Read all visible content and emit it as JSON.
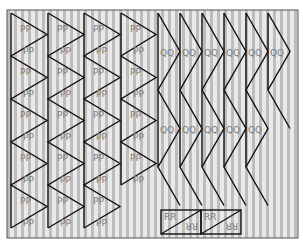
{
  "figure": {
    "width": 303,
    "height": 244,
    "frame": {
      "x": 7,
      "y": 10,
      "w": 291,
      "h": 228,
      "stroke": "#555555"
    },
    "background": {
      "stripe_light": "#e9e9e9",
      "stripe_dark": "#bdbdbd",
      "period": 7,
      "dark_width": 3
    }
  },
  "pp_group": {
    "label": "PP",
    "columns": [
      {
        "x": 11,
        "width": 36,
        "top": 13,
        "vertices": 10
      },
      {
        "x": 48,
        "width": 36,
        "top": 13,
        "vertices": 10
      },
      {
        "x": 84,
        "width": 36,
        "top": 13,
        "vertices": 10
      },
      {
        "x": 121,
        "width": 35,
        "top": 13,
        "vertices": 8
      }
    ],
    "step": 21.5
  },
  "qq_group": {
    "label": "QQ",
    "columns": [
      {
        "x": 158,
        "width": 22,
        "vertices": 5
      },
      {
        "x": 180,
        "width": 22,
        "vertices": 5
      },
      {
        "x": 202,
        "width": 22,
        "vertices": 5
      },
      {
        "x": 224,
        "width": 22,
        "vertices": 5
      },
      {
        "x": 246,
        "width": 22,
        "vertices": 5
      },
      {
        "x": 268,
        "width": 22,
        "vertices": 3
      }
    ],
    "top": 13,
    "step": 38.5
  },
  "rr_group": {
    "label": "RR",
    "boxes": [
      {
        "x": 161,
        "y": 210,
        "w": 40,
        "h": 24
      },
      {
        "x": 201,
        "y": 210,
        "w": 40,
        "h": 24
      }
    ]
  }
}
